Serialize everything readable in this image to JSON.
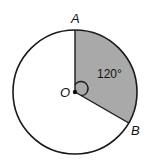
{
  "diagram": {
    "center_label": "O",
    "point_a_label": "A",
    "point_b_label": "B",
    "angle_label": "120°",
    "sector_angle_degrees": 120,
    "colors": {
      "sector_fill": "#a9a9a9",
      "stroke": "#1a1a1a",
      "background": "#ffffff"
    }
  }
}
